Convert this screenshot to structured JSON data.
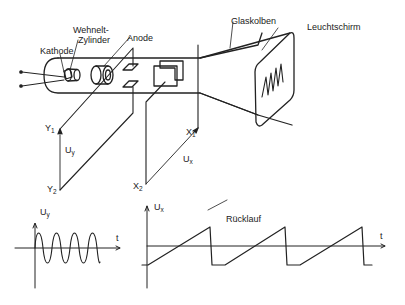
{
  "labels": {
    "kathode": "Kathode",
    "wehnelt_line1": "Wehnelt-",
    "wehnelt_line2": "Zylinder",
    "anode": "Anode",
    "glaskolben": "Glaskolben",
    "leuchtschirm": "Leuchtschirm",
    "y1": "Y",
    "y1_sub": "1",
    "y2": "Y",
    "y2_sub": "2",
    "uy": "U",
    "uy_sub": "y",
    "x1": "X",
    "x1_sub": "1",
    "x2": "X",
    "x2_sub": "2",
    "ux": "U",
    "ux_sub": "x",
    "plot_left_ylabel": "U",
    "plot_left_ylabel_sub": "y",
    "plot_left_xlabel": "t",
    "plot_right_ylabel": "U",
    "plot_right_ylabel_sub": "x",
    "plot_right_xlabel": "t",
    "ruecklauf": "Rücklauf"
  },
  "colors": {
    "ink": "#222222",
    "background": "#ffffff"
  }
}
